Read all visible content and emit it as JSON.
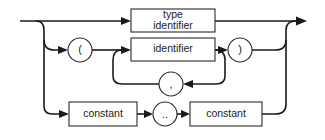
{
  "diagram": {
    "type": "syntax-diagram",
    "nodes": {
      "type_identifier": {
        "kind": "box",
        "line1": "type",
        "line2": "identifier"
      },
      "open_paren": {
        "kind": "terminal",
        "label": "("
      },
      "identifier": {
        "kind": "box",
        "label": "identifier"
      },
      "close_paren": {
        "kind": "terminal",
        "label": ")"
      },
      "comma": {
        "kind": "terminal",
        "label": ","
      },
      "constant_low": {
        "kind": "box",
        "label": "constant"
      },
      "range_dots": {
        "kind": "terminal",
        "label": ".."
      },
      "constant_high": {
        "kind": "box",
        "label": "constant"
      }
    },
    "paths": [
      [
        "start",
        "type_identifier",
        "end"
      ],
      [
        "start",
        "open_paren",
        "identifier",
        "close_paren",
        "end"
      ],
      [
        "identifier",
        "comma",
        "identifier"
      ],
      [
        "start",
        "constant_low",
        "range_dots",
        "constant_high",
        "end"
      ]
    ],
    "colors": {
      "stroke": "#1a1a1a",
      "fill": "#ffffff"
    }
  }
}
